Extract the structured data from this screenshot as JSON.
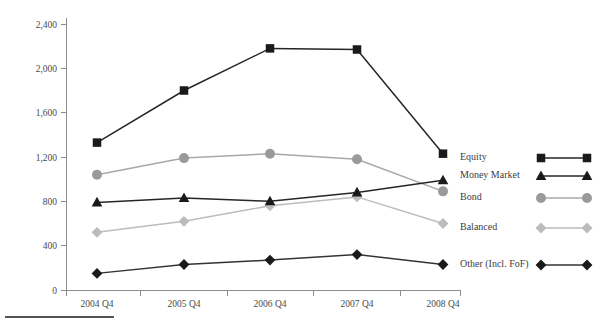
{
  "chart_data": {
    "type": "line",
    "title": "",
    "subtitle": "",
    "xlabel": "",
    "ylabel": "",
    "categories": [
      "2004 Q4",
      "2005 Q4",
      "2006 Q4",
      "2007 Q4",
      "2008 Q4"
    ],
    "ylim": [
      0,
      2400
    ],
    "yticks": [
      0,
      400,
      800,
      1200,
      1600,
      2000,
      2400
    ],
    "ytick_labels": [
      "0",
      "400",
      "800",
      "1,200",
      "1,600",
      "2,000",
      "2,400"
    ],
    "grid": false,
    "legend_position": "right",
    "series": [
      {
        "name": "Equity",
        "marker": "square",
        "color": "#1a1a1a",
        "line_color": "#262626",
        "values": [
          1330,
          1800,
          2180,
          2170,
          1230
        ]
      },
      {
        "name": "Money Market",
        "marker": "triangle",
        "color": "#1a1a1a",
        "line_color": "#262626",
        "values": [
          790,
          830,
          800,
          880,
          990
        ]
      },
      {
        "name": "Bond",
        "marker": "circle",
        "color": "#9a9a9a",
        "line_color": "#a8a8a8",
        "values": [
          1040,
          1190,
          1230,
          1180,
          890
        ]
      },
      {
        "name": "Balanced",
        "marker": "diamond",
        "color": "#bcbcbc",
        "line_color": "#bcbcbc",
        "values": [
          520,
          620,
          760,
          840,
          600
        ]
      },
      {
        "name": "Other (Incl. FoF)",
        "marker": "diamond",
        "color": "#1a1a1a",
        "line_color": "#333333",
        "values": [
          150,
          230,
          270,
          320,
          230
        ]
      }
    ]
  },
  "legend": {
    "items": [
      {
        "label": "Equity"
      },
      {
        "label": "Money Market"
      },
      {
        "label": "Bond"
      },
      {
        "label": "Balanced"
      },
      {
        "label": "Other (Incl. FoF)"
      }
    ]
  },
  "axes": {
    "y_tick_labels": [
      "2,400",
      "2,000",
      "1,600",
      "1,200",
      "800",
      "400",
      "0"
    ],
    "x_tick_labels": [
      "2004 Q4",
      "2005 Q4",
      "2006 Q4",
      "2007 Q4",
      "2008 Q4"
    ]
  }
}
